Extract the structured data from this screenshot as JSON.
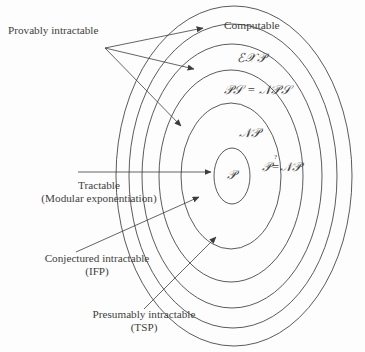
{
  "figure": {
    "background_color": "#fdfdfd",
    "stroke_color": "#3d3d3d",
    "text_color": "#3d3d3d"
  },
  "sets": {
    "computable": "Computable",
    "exp": "ℰ𝒳𝒫",
    "pspace": "𝒫𝒮 = 𝒩𝒫𝒮",
    "np": "𝒩𝒫",
    "p": "𝒫",
    "p_vs_np_left": "𝒫",
    "p_vs_np_rel": "=",
    "p_vs_np_qmark": "?",
    "p_vs_np_right": "𝒩𝒫"
  },
  "annotations": {
    "provably": {
      "line1": "Provably intractable",
      "line2": ""
    },
    "tractable": {
      "line1": "Tractable",
      "line2": "(Modular exponentiation)"
    },
    "conjectured": {
      "line1": "Conjectured intractable",
      "line2": "(IFP)"
    },
    "presumably": {
      "line1": "Presumably intractable",
      "line2": "(TSP)"
    }
  }
}
